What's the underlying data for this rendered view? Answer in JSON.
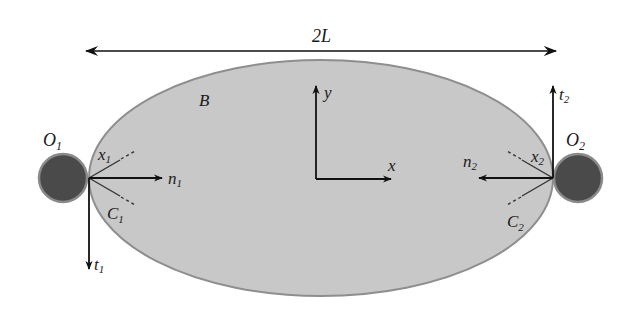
{
  "diagram": {
    "colors": {
      "background": "#ffffff",
      "body_fill": "#c8c8c8",
      "body_stroke": "#8e8e8e",
      "finger_fill": "#4a4a4a",
      "finger_stroke": "#8a8a8a",
      "line": "#111111"
    },
    "labels": {
      "length": "2L",
      "body": "B",
      "y_axis": "y",
      "x_axis": "x",
      "finger1": {
        "main": "O",
        "sub": "1"
      },
      "finger2": {
        "main": "O",
        "sub": "2"
      },
      "x1": {
        "main": "x",
        "sub": "1"
      },
      "c1": {
        "main": "C",
        "sub": "1"
      },
      "n1": {
        "main": "n",
        "sub": "1"
      },
      "t1": {
        "main": "t",
        "sub": "1"
      },
      "x2": {
        "main": "x",
        "sub": "2"
      },
      "c2": {
        "main": "C",
        "sub": "2"
      },
      "n2": {
        "main": "n",
        "sub": "2"
      },
      "t2": {
        "main": "t",
        "sub": "2"
      }
    },
    "geometry": {
      "ellipse": {
        "cx": 321,
        "cy": 178,
        "rx": 232,
        "ry": 118
      },
      "finger1": {
        "cx": 63,
        "cy": 178,
        "r": 24
      },
      "finger2": {
        "cx": 578,
        "cy": 178,
        "r": 24
      },
      "length_arrow": {
        "x1": 86,
        "x2": 556,
        "y": 51
      },
      "origin": {
        "x": 316,
        "y": 179
      }
    }
  }
}
